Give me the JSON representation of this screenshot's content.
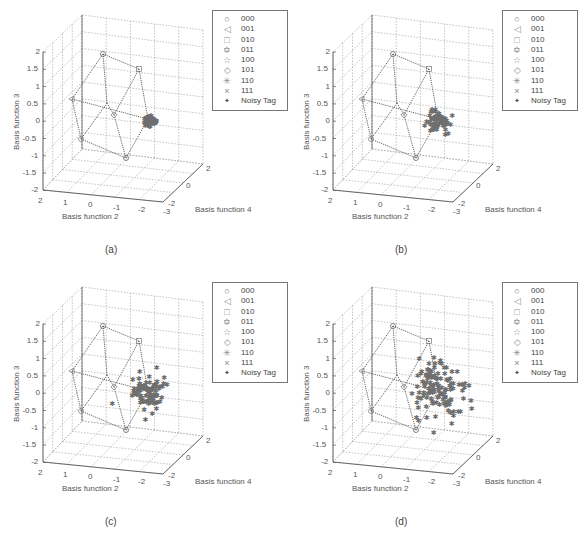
{
  "figure": {
    "panels": [
      {
        "id": "a",
        "caption": "(a)",
        "cluster_spread": [
          5,
          5
        ],
        "n_points": 60
      },
      {
        "id": "b",
        "caption": "(b)",
        "cluster_spread": [
          11,
          9
        ],
        "n_points": 70
      },
      {
        "id": "c",
        "caption": "(c)",
        "cluster_spread": [
          15,
          16
        ],
        "n_points": 90
      },
      {
        "id": "d",
        "caption": "(d)",
        "cluster_spread": [
          24,
          28
        ],
        "n_points": 120
      }
    ],
    "legend": [
      {
        "symbol": "○",
        "label": "000"
      },
      {
        "symbol": "◁",
        "label": "001"
      },
      {
        "symbol": "□",
        "label": "010"
      },
      {
        "symbol": "✡",
        "label": "011"
      },
      {
        "symbol": "☆",
        "label": "100"
      },
      {
        "symbol": "◇",
        "label": "101"
      },
      {
        "symbol": "✳",
        "label": "110"
      },
      {
        "symbol": "×",
        "label": "111"
      },
      {
        "symbol": "✦",
        "label": "Noisy Tag"
      }
    ],
    "axes": {
      "z_label": "Basis function 3",
      "x_label": "Basis function 2",
      "y_label": "Basis function 4",
      "z_ticks": [
        "2",
        "1.5",
        "1",
        "0.5",
        "0",
        "-0.5",
        "-1",
        "-1.5",
        "-2"
      ],
      "x_ticks": [
        "2",
        "1",
        "0",
        "-1",
        "-2",
        "-3"
      ],
      "y_ticks": [
        "-2",
        "0",
        "2"
      ]
    },
    "colors": {
      "noisy": "#6e6e6e",
      "grid": "#9a9a9a",
      "cube": "#555555",
      "axis": "#666666"
    }
  },
  "chart_data": [
    {
      "type": "scatter",
      "title": "(a)",
      "xlabel": "Basis function 2",
      "ylabel": "Basis function 4",
      "zlabel": "Basis function 3",
      "xlim": [
        -3,
        2
      ],
      "ylim": [
        -2,
        2
      ],
      "zlim": [
        -2,
        2
      ],
      "series": [
        {
          "name": "Constellation 000-111",
          "points": "8 cube vertices (000,001,010,011,100,101,110,111) joined by dotted edges"
        },
        {
          "name": "Noisy Tag",
          "description": "tight cluster around the point near (x≈-2, z≈0)",
          "spread": "very small"
        }
      ],
      "legend": [
        "000",
        "001",
        "010",
        "011",
        "100",
        "101",
        "110",
        "111",
        "Noisy Tag"
      ],
      "grid": true,
      "legend_position": "upper right"
    },
    {
      "type": "scatter",
      "title": "(b)",
      "xlabel": "Basis function 2",
      "ylabel": "Basis function 4",
      "zlabel": "Basis function 3",
      "xlim": [
        -3,
        2
      ],
      "ylim": [
        -2,
        2
      ],
      "zlim": [
        -2,
        2
      ],
      "series": [
        {
          "name": "Noisy Tag",
          "spread": "small"
        }
      ],
      "legend": [
        "000",
        "001",
        "010",
        "011",
        "100",
        "101",
        "110",
        "111",
        "Noisy Tag"
      ],
      "grid": true,
      "legend_position": "upper right"
    },
    {
      "type": "scatter",
      "title": "(c)",
      "xlabel": "Basis function 2",
      "ylabel": "Basis function 4",
      "zlabel": "Basis function 3",
      "xlim": [
        -3,
        2
      ],
      "ylim": [
        -2,
        2
      ],
      "zlim": [
        -2,
        2
      ],
      "series": [
        {
          "name": "Noisy Tag",
          "spread": "medium"
        }
      ],
      "legend": [
        "000",
        "001",
        "010",
        "011",
        "100",
        "101",
        "110",
        "111",
        "Noisy Tag"
      ],
      "grid": true,
      "legend_position": "upper right"
    },
    {
      "type": "scatter",
      "title": "(d)",
      "xlabel": "Basis function 2",
      "ylabel": "Basis function 4",
      "zlabel": "Basis function 3",
      "xlim": [
        -3,
        2
      ],
      "ylim": [
        -2,
        2
      ],
      "zlim": [
        -2,
        2
      ],
      "series": [
        {
          "name": "Noisy Tag",
          "spread": "large"
        }
      ],
      "legend": [
        "000",
        "001",
        "010",
        "011",
        "100",
        "101",
        "110",
        "111",
        "Noisy Tag"
      ],
      "grid": true,
      "legend_position": "upper right"
    }
  ]
}
